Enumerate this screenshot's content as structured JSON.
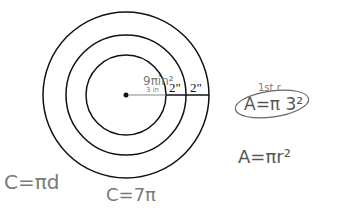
{
  "diagram": {
    "center": {
      "x": 126,
      "y": 95
    },
    "circles": [
      {
        "name": "inner",
        "r": 40
      },
      {
        "name": "middle",
        "r": 60
      },
      {
        "name": "outer",
        "r": 83
      }
    ],
    "segment_labels": [
      "2\"",
      "2\""
    ],
    "inner_annotations": {
      "area": "9πin²",
      "radius": "3 in"
    }
  },
  "notes": {
    "circumference_formula": "C=πd",
    "circumference_value": "C=7π",
    "first_ring_label": "1st r",
    "area_first": "A=π 3²",
    "area_formula": "A=πr²"
  },
  "colors": {
    "ink": "#111111",
    "pencil": "#7a7a7a"
  }
}
